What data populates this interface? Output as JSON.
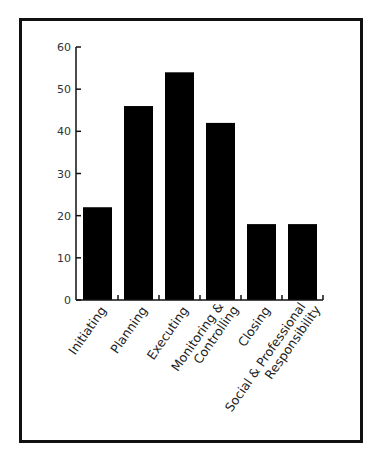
{
  "chart_data": {
    "type": "bar",
    "title": "",
    "xlabel": "",
    "ylabel": "",
    "categories": [
      "Initiating",
      "Planning",
      "Executing",
      "Monitoring & Controlling",
      "Closing",
      "Social & Professional Responsibility"
    ],
    "category_lines": [
      [
        "Initiating"
      ],
      [
        "Planning"
      ],
      [
        "Executing"
      ],
      [
        "Monitoring &",
        "Controlling"
      ],
      [
        "Closing"
      ],
      [
        "Social & Professional",
        "Responsibility"
      ]
    ],
    "values": [
      22,
      46,
      54,
      42,
      18,
      18
    ],
    "ylim": [
      0,
      60
    ],
    "yticks": [
      0,
      10,
      20,
      30,
      40,
      50,
      60
    ],
    "grid": false,
    "legend": null,
    "bar_color": "#000000"
  }
}
